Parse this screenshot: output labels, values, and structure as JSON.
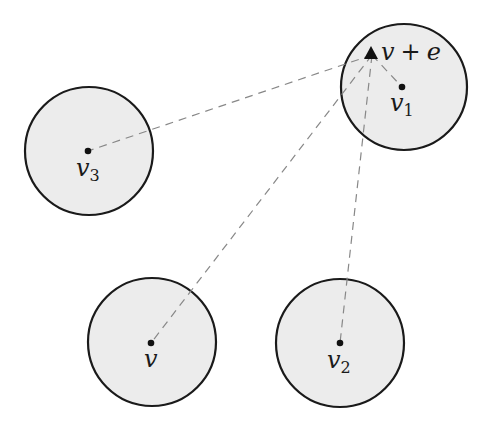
{
  "diagram": {
    "type": "geometric-neighborhoods",
    "colors": {
      "disk_fill": "#ececec",
      "disk_stroke": "#1a1a1a",
      "dash": "#888888",
      "point": "#111111"
    },
    "disks": [
      {
        "id": "v1",
        "label": "v",
        "subscript": "1",
        "cx": 404,
        "cy": 87,
        "r": 63,
        "dot": [
          402,
          87
        ]
      },
      {
        "id": "v3",
        "label": "v",
        "subscript": "3",
        "cx": 89,
        "cy": 151,
        "r": 64,
        "dot": [
          88,
          151
        ]
      },
      {
        "id": "v",
        "label": "v",
        "subscript": "",
        "cx": 152,
        "cy": 342,
        "r": 64,
        "dot": [
          151,
          343
        ]
      },
      {
        "id": "v2",
        "label": "v",
        "subscript": "2",
        "cx": 340,
        "cy": 343,
        "r": 64,
        "dot": [
          340,
          343
        ]
      }
    ],
    "target_point": {
      "label": "v + e",
      "label_v": "v",
      "label_op": "+",
      "label_e": "e",
      "marker": "triangle",
      "x": 372,
      "y": 53
    },
    "dashed_edges": [
      {
        "from": "target",
        "to": "v1"
      },
      {
        "from": "target",
        "to": "v3"
      },
      {
        "from": "target",
        "to": "v"
      },
      {
        "from": "target",
        "to": "v2"
      }
    ]
  }
}
